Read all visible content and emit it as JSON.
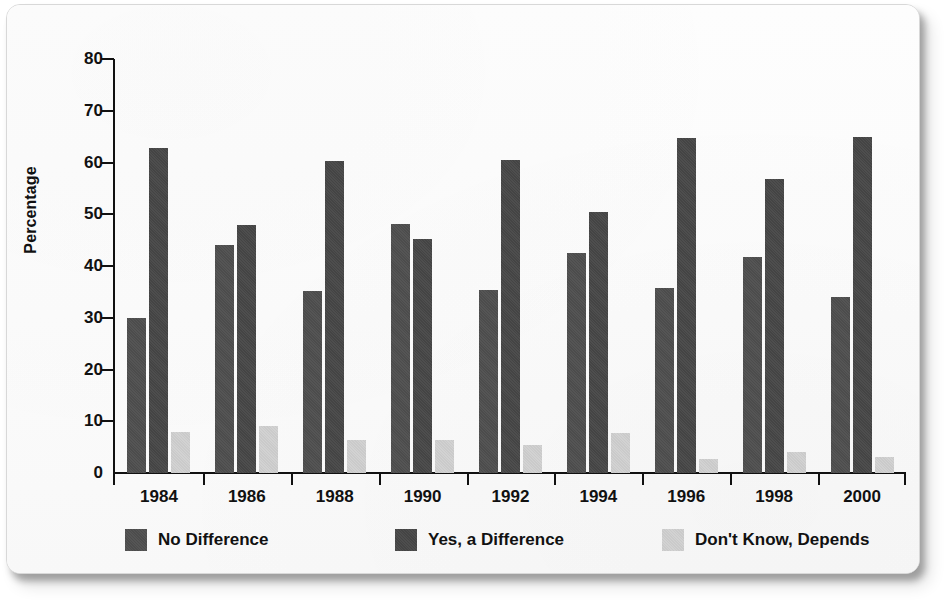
{
  "chart_data": {
    "type": "bar",
    "title": "",
    "subtitle": "",
    "xlabel": "",
    "ylabel": "Percentage",
    "ylim": [
      0,
      80
    ],
    "yticks": [
      0,
      10,
      20,
      30,
      40,
      50,
      60,
      70,
      80
    ],
    "ytick_labels": [
      "0",
      "10",
      "20",
      "30",
      "40",
      "50",
      "60",
      "70",
      "80"
    ],
    "grid": false,
    "legend_position": "bottom",
    "categories": [
      "1984",
      "1986",
      "1988",
      "1990",
      "1992",
      "1994",
      "1996",
      "1998",
      "2000"
    ],
    "series": [
      {
        "name": "No Difference",
        "color": "#4c4c4c",
        "values": [
          29.9,
          44.0,
          35.1,
          48.2,
          35.4,
          42.5,
          35.8,
          41.8,
          34.0
        ]
      },
      {
        "name": "Yes, a Difference",
        "color": "#444444",
        "values": [
          62.8,
          48.0,
          60.2,
          45.3,
          60.5,
          50.5,
          64.8,
          56.9,
          65.0
        ]
      },
      {
        "name": "Don't Know, Depends",
        "color": "#d2d2d2",
        "values": [
          8.0,
          9.1,
          6.3,
          6.4,
          5.5,
          7.7,
          2.8,
          4.0,
          3.1
        ]
      }
    ]
  },
  "legend": {
    "items": [
      {
        "label": "No Difference",
        "color": "#4c4c4c"
      },
      {
        "label": "Yes, a Difference",
        "color": "#444444"
      },
      {
        "label": "Don't Know, Depends",
        "color": "#d2d2d2"
      }
    ]
  },
  "axis": {
    "y_title": "Percentage"
  }
}
